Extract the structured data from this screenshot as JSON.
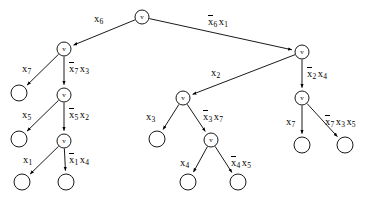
{
  "diagram": {
    "type": "binary-decision-tree",
    "title": "",
    "node_label": "v",
    "nodes": [
      {
        "id": "n0",
        "kind": "internal",
        "label": "v",
        "x": 142,
        "y": 17,
        "r": 7
      },
      {
        "id": "n1",
        "kind": "internal",
        "label": "v",
        "x": 64,
        "y": 49,
        "r": 7
      },
      {
        "id": "n2",
        "kind": "internal",
        "label": "v",
        "x": 302,
        "y": 52,
        "r": 7
      },
      {
        "id": "n3",
        "kind": "leaf",
        "label": "",
        "x": 19,
        "y": 93,
        "r": 8
      },
      {
        "id": "n4",
        "kind": "internal",
        "label": "v",
        "x": 64,
        "y": 95,
        "r": 7
      },
      {
        "id": "n5",
        "kind": "internal",
        "label": "v",
        "x": 183,
        "y": 98,
        "r": 7
      },
      {
        "id": "n6",
        "kind": "internal",
        "label": "v",
        "x": 302,
        "y": 98,
        "r": 7
      },
      {
        "id": "n7",
        "kind": "leaf",
        "label": "",
        "x": 19,
        "y": 139,
        "r": 8
      },
      {
        "id": "n8",
        "kind": "internal",
        "label": "v",
        "x": 64,
        "y": 141,
        "r": 7
      },
      {
        "id": "n9",
        "kind": "leaf",
        "label": "",
        "x": 157,
        "y": 139,
        "r": 8
      },
      {
        "id": "n10",
        "kind": "internal",
        "label": "v",
        "x": 211,
        "y": 140,
        "r": 7
      },
      {
        "id": "n11",
        "kind": "leaf",
        "label": "",
        "x": 302,
        "y": 145,
        "r": 8
      },
      {
        "id": "n12",
        "kind": "leaf",
        "label": "",
        "x": 345,
        "y": 145,
        "r": 8
      },
      {
        "id": "n13",
        "kind": "leaf",
        "label": "",
        "x": 22,
        "y": 182,
        "r": 8
      },
      {
        "id": "n14",
        "kind": "leaf",
        "label": "",
        "x": 66,
        "y": 182,
        "r": 8
      },
      {
        "id": "n15",
        "kind": "leaf",
        "label": "",
        "x": 188,
        "y": 182,
        "r": 8
      },
      {
        "id": "n16",
        "kind": "leaf",
        "label": "",
        "x": 238,
        "y": 182,
        "r": 8
      }
    ],
    "edges": [
      {
        "id": "e0",
        "from": "n0",
        "to": "n1",
        "side": "left",
        "label_text": "x6",
        "literals": [
          {
            "var": "x",
            "sub": "6",
            "negated": false
          }
        ],
        "label_x": 94,
        "label_y": 14
      },
      {
        "id": "e1",
        "from": "n0",
        "to": "n2",
        "side": "right",
        "label_text": "x̄6 x1",
        "literals": [
          {
            "var": "x",
            "sub": "6",
            "negated": true
          },
          {
            "var": "x",
            "sub": "1",
            "negated": false
          }
        ],
        "label_x": 208,
        "label_y": 17
      },
      {
        "id": "e2",
        "from": "n1",
        "to": "n3",
        "side": "left",
        "label_text": "x7",
        "literals": [
          {
            "var": "x",
            "sub": "7",
            "negated": false
          }
        ],
        "label_x": 22,
        "label_y": 64
      },
      {
        "id": "e3",
        "from": "n1",
        "to": "n4",
        "side": "down",
        "label_text": "x̄7 x3",
        "literals": [
          {
            "var": "x",
            "sub": "7",
            "negated": true
          },
          {
            "var": "x",
            "sub": "3",
            "negated": false
          }
        ],
        "label_x": 69,
        "label_y": 64
      },
      {
        "id": "e4",
        "from": "n4",
        "to": "n7",
        "side": "left",
        "label_text": "x5",
        "literals": [
          {
            "var": "x",
            "sub": "5",
            "negated": false
          }
        ],
        "label_x": 22,
        "label_y": 110
      },
      {
        "id": "e5",
        "from": "n4",
        "to": "n8",
        "side": "down",
        "label_text": "x̄5 x2",
        "literals": [
          {
            "var": "x",
            "sub": "5",
            "negated": true
          },
          {
            "var": "x",
            "sub": "2",
            "negated": false
          }
        ],
        "label_x": 69,
        "label_y": 110
      },
      {
        "id": "e6",
        "from": "n8",
        "to": "n13",
        "side": "left",
        "label_text": "x1",
        "literals": [
          {
            "var": "x",
            "sub": "1",
            "negated": false
          }
        ],
        "label_x": 23,
        "label_y": 155
      },
      {
        "id": "e7",
        "from": "n8",
        "to": "n14",
        "side": "down",
        "label_text": "x̄1 x4",
        "literals": [
          {
            "var": "x",
            "sub": "1",
            "negated": true
          },
          {
            "var": "x",
            "sub": "4",
            "negated": false
          }
        ],
        "label_x": 69,
        "label_y": 155
      },
      {
        "id": "e8",
        "from": "n2",
        "to": "n5",
        "side": "left",
        "label_text": "x2",
        "literals": [
          {
            "var": "x",
            "sub": "2",
            "negated": false
          }
        ],
        "label_x": 211,
        "label_y": 68
      },
      {
        "id": "e9",
        "from": "n2",
        "to": "n6",
        "side": "down",
        "label_text": "x̄2 x4",
        "literals": [
          {
            "var": "x",
            "sub": "2",
            "negated": true
          },
          {
            "var": "x",
            "sub": "4",
            "negated": false
          }
        ],
        "label_x": 307,
        "label_y": 69
      },
      {
        "id": "e10",
        "from": "n5",
        "to": "n9",
        "side": "left",
        "label_text": "x3",
        "literals": [
          {
            "var": "x",
            "sub": "3",
            "negated": false
          }
        ],
        "label_x": 146,
        "label_y": 112
      },
      {
        "id": "e11",
        "from": "n5",
        "to": "n10",
        "side": "right",
        "label_text": "x̄3 x7",
        "literals": [
          {
            "var": "x",
            "sub": "3",
            "negated": true
          },
          {
            "var": "x",
            "sub": "7",
            "negated": false
          }
        ],
        "label_x": 203,
        "label_y": 112
      },
      {
        "id": "e12",
        "from": "n6",
        "to": "n11",
        "side": "left",
        "label_text": "x7",
        "literals": [
          {
            "var": "x",
            "sub": "7",
            "negated": false
          }
        ],
        "label_x": 286,
        "label_y": 117
      },
      {
        "id": "e13",
        "from": "n6",
        "to": "n12",
        "side": "right",
        "label_text": "x̄7 x3 x5",
        "literals": [
          {
            "var": "x",
            "sub": "7",
            "negated": true
          },
          {
            "var": "x",
            "sub": "3",
            "negated": false
          },
          {
            "var": "x",
            "sub": "5",
            "negated": false
          }
        ],
        "label_x": 325,
        "label_y": 117
      },
      {
        "id": "e14",
        "from": "n10",
        "to": "n15",
        "side": "left",
        "label_text": "x4",
        "literals": [
          {
            "var": "x",
            "sub": "4",
            "negated": false
          }
        ],
        "label_x": 180,
        "label_y": 158
      },
      {
        "id": "e15",
        "from": "n10",
        "to": "n16",
        "side": "right",
        "label_text": "x̄4 x5",
        "literals": [
          {
            "var": "x",
            "sub": "4",
            "negated": true
          },
          {
            "var": "x",
            "sub": "5",
            "negated": false
          }
        ],
        "label_x": 231,
        "label_y": 158
      }
    ],
    "colors": {
      "stroke": "#000000",
      "fill": "#ffffff",
      "background": "#ffffff"
    }
  }
}
